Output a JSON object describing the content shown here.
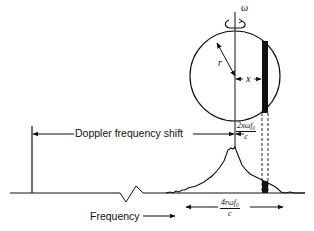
{
  "diagram": {
    "labels": {
      "doppler_shift": "Doppler frequency shift",
      "frequency": "Frequency",
      "omega": "ω",
      "radius": "r",
      "offset": "x"
    },
    "fractions": {
      "shift": {
        "numerator": "2xωf₀",
        "denominator": "c"
      },
      "bandwidth": {
        "numerator": "4rωf₀",
        "denominator": "c"
      }
    },
    "colors": {
      "ink": "#111111",
      "background": "#ffffff"
    }
  }
}
